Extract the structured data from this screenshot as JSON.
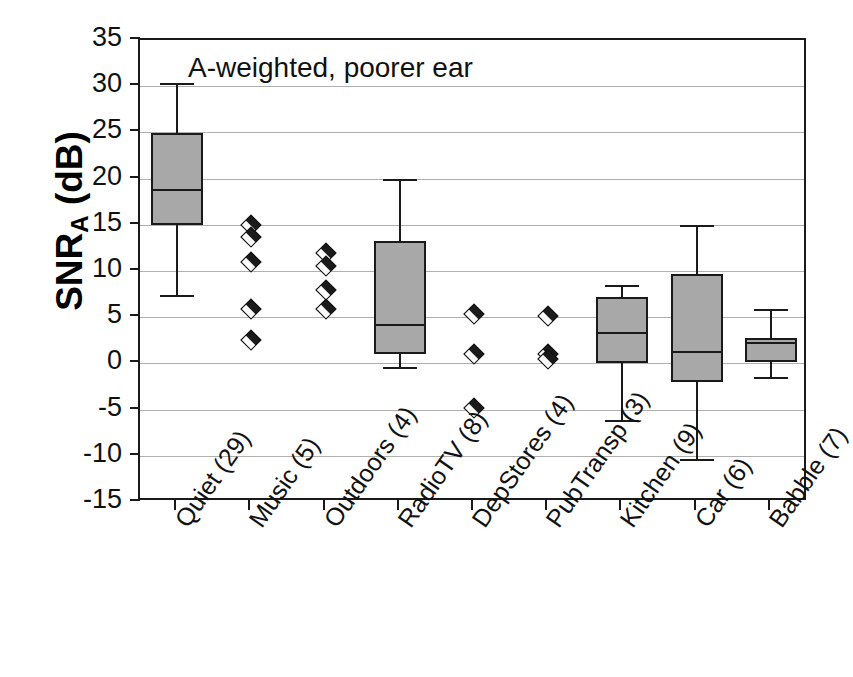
{
  "chart_data": {
    "type": "box",
    "title": "",
    "annotation": "A-weighted, poorer ear",
    "xlabel": "",
    "ylabel": "SNR",
    "ylabel_sub": "A",
    "ylabel_units": " (dB)",
    "ylim": [
      -15,
      35
    ],
    "ytick_step": 5,
    "yticks": [
      "35",
      "30",
      "25",
      "20",
      "15",
      "10",
      "5",
      "0",
      "-5",
      "-10",
      "-15"
    ],
    "grid": "horizontal",
    "legend": "none",
    "categories": [
      "Quiet (29)",
      "Music (5)",
      "Outdoors (4)",
      "RadioTV (8)",
      "DepStores (4)",
      "PubTransp (3)",
      "Kitchen (9)",
      "Car (6)",
      "Babble (7)"
    ],
    "counts": [
      29,
      5,
      4,
      8,
      4,
      3,
      9,
      6,
      7
    ],
    "boxes": [
      {
        "name": "Quiet (29)",
        "render": "box",
        "whisker_low": 7.3,
        "q1": 15.0,
        "median": 18.8,
        "q3": 24.9,
        "whisker_high": 30.2,
        "points": []
      },
      {
        "name": "Music (5)",
        "render": "points",
        "whisker_low": null,
        "q1": null,
        "median": null,
        "q3": null,
        "whisker_high": null,
        "points": [
          15.0,
          13.7,
          11.0,
          5.9,
          2.5
        ]
      },
      {
        "name": "Outdoors (4)",
        "render": "points",
        "whisker_low": null,
        "q1": null,
        "median": null,
        "q3": null,
        "whisker_high": null,
        "points": [
          12.0,
          10.5,
          7.9,
          5.9
        ]
      },
      {
        "name": "RadioTV (8)",
        "render": "box",
        "whisker_low": -0.5,
        "q1": 1.0,
        "median": 4.2,
        "q3": 13.3,
        "whisker_high": 19.8,
        "points": []
      },
      {
        "name": "DepStores (4)",
        "render": "points",
        "whisker_low": null,
        "q1": null,
        "median": null,
        "q3": null,
        "whisker_high": null,
        "points": [
          5.3,
          1.0,
          -4.8
        ]
      },
      {
        "name": "PubTransp (3)",
        "render": "points",
        "whisker_low": null,
        "q1": null,
        "median": null,
        "q3": null,
        "whisker_high": null,
        "points": [
          5.1,
          1.0,
          0.5
        ]
      },
      {
        "name": "Kitchen (9)",
        "render": "box",
        "whisker_low": -6.2,
        "q1": 0.0,
        "median": 3.3,
        "q3": 7.2,
        "whisker_high": 8.4,
        "points": []
      },
      {
        "name": "Car (6)",
        "render": "box",
        "whisker_low": -10.5,
        "q1": -2.0,
        "median": 1.2,
        "q3": 9.7,
        "whisker_high": 14.9,
        "points": []
      },
      {
        "name": "Babble (7)",
        "render": "box",
        "whisker_low": -1.6,
        "q1": 0.1,
        "median": 2.2,
        "q3": 2.8,
        "whisker_high": 5.8,
        "points": []
      }
    ],
    "colors": {
      "box_fill": "#a8a8a8",
      "line": "#1a1a1a",
      "grid": "#b0b0b0",
      "background": "#ffffff"
    }
  }
}
